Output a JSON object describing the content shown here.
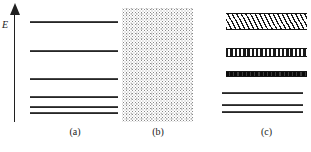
{
  "figure": {
    "axis": {
      "label": "E",
      "icon": "up-arrow-icon",
      "direction": "up",
      "meaning": "energy increases upward"
    },
    "ink_color": "#1a1a1a",
    "background_color": "#ffffff",
    "panels": [
      {
        "id": "a",
        "caption": "(a)",
        "kind": "discrete-levels",
        "levels": [
          {
            "y": 21,
            "width": 88,
            "thickness": 2
          },
          {
            "y": 50,
            "width": 88,
            "thickness": 2
          },
          {
            "y": 78,
            "width": 88,
            "thickness": 2
          },
          {
            "y": 96,
            "width": 88,
            "thickness": 1.6
          },
          {
            "y": 106,
            "width": 88,
            "thickness": 1.6
          },
          {
            "y": 112,
            "width": 88,
            "thickness": 2
          }
        ]
      },
      {
        "id": "b",
        "caption": "(b)",
        "kind": "stipple-block",
        "block": {
          "x": 4,
          "y": 8,
          "width": 71,
          "height": 114,
          "fill": "stipple-dots"
        }
      },
      {
        "id": "c",
        "caption": "(c)",
        "kind": "bands",
        "bands": [
          {
            "y": 13,
            "height": 17,
            "fill": "hatched",
            "name": "conduction-band"
          },
          {
            "y": 48,
            "height": 9,
            "fill": "dashed",
            "name": "upper-filled-band"
          },
          {
            "y": 71,
            "height": 6,
            "fill": "solid",
            "name": "valence-band"
          }
        ],
        "levels": [
          {
            "y": 92,
            "width": 81,
            "thickness": 1.6
          },
          {
            "y": 104,
            "width": 81,
            "thickness": 1.6
          },
          {
            "y": 111,
            "width": 81,
            "thickness": 2
          }
        ]
      }
    ]
  }
}
